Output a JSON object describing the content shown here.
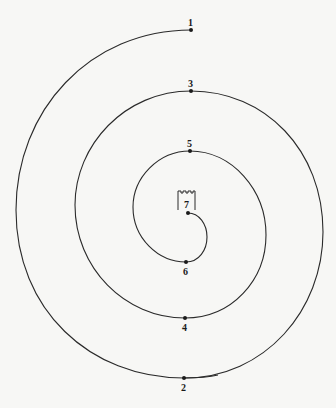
{
  "figure": {
    "type": "spiral-path",
    "stroke_color": "#2a2a2a",
    "points": [
      {
        "label": "1",
        "x": 191,
        "y": 30
      },
      {
        "label": "2",
        "x": 184,
        "y": 378
      },
      {
        "label": "3",
        "x": 191,
        "y": 91
      },
      {
        "label": "4",
        "x": 185,
        "y": 318
      },
      {
        "label": "5",
        "x": 190,
        "y": 151
      },
      {
        "label": "6",
        "x": 186,
        "y": 262
      },
      {
        "label": "7",
        "x": 188,
        "y": 213
      }
    ],
    "center_icon": "tower-icon"
  },
  "background": {
    "bleed_through_text": "mirrored illegible text from reverse of page"
  }
}
